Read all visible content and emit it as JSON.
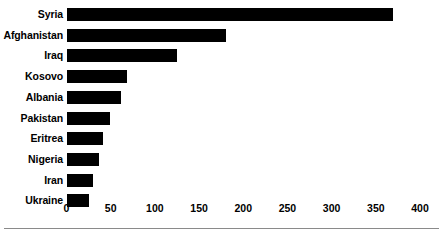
{
  "chart_data": {
    "type": "bar",
    "orientation": "horizontal",
    "title": "",
    "subtitle": "",
    "xlabel": "",
    "ylabel": "",
    "categories": [
      "Syria",
      "Afghanistan",
      "Iraq",
      "Kosovo",
      "Albania",
      "Pakistan",
      "Eritrea",
      "Nigeria",
      "Iran",
      "Ukraine"
    ],
    "values": [
      370,
      180,
      125,
      68,
      62,
      49,
      41,
      37,
      30,
      26
    ],
    "series": [
      {
        "name": "",
        "values": [
          370,
          180,
          125,
          68,
          62,
          49,
          41,
          37,
          30,
          26
        ]
      }
    ],
    "xlim": [
      0,
      400
    ],
    "xticks": [
      0,
      50,
      100,
      150,
      200,
      250,
      300,
      350,
      400
    ],
    "xtick_labels": [
      "0",
      "50",
      "100",
      "150",
      "200",
      "250",
      "300",
      "350",
      "400"
    ],
    "grid": false,
    "legend": false,
    "legend_position": "none",
    "bar_color": "#000000",
    "background_color": "#ffffff",
    "text_color": "#000000",
    "rule_color": "#8a8a8a",
    "annotations": []
  }
}
